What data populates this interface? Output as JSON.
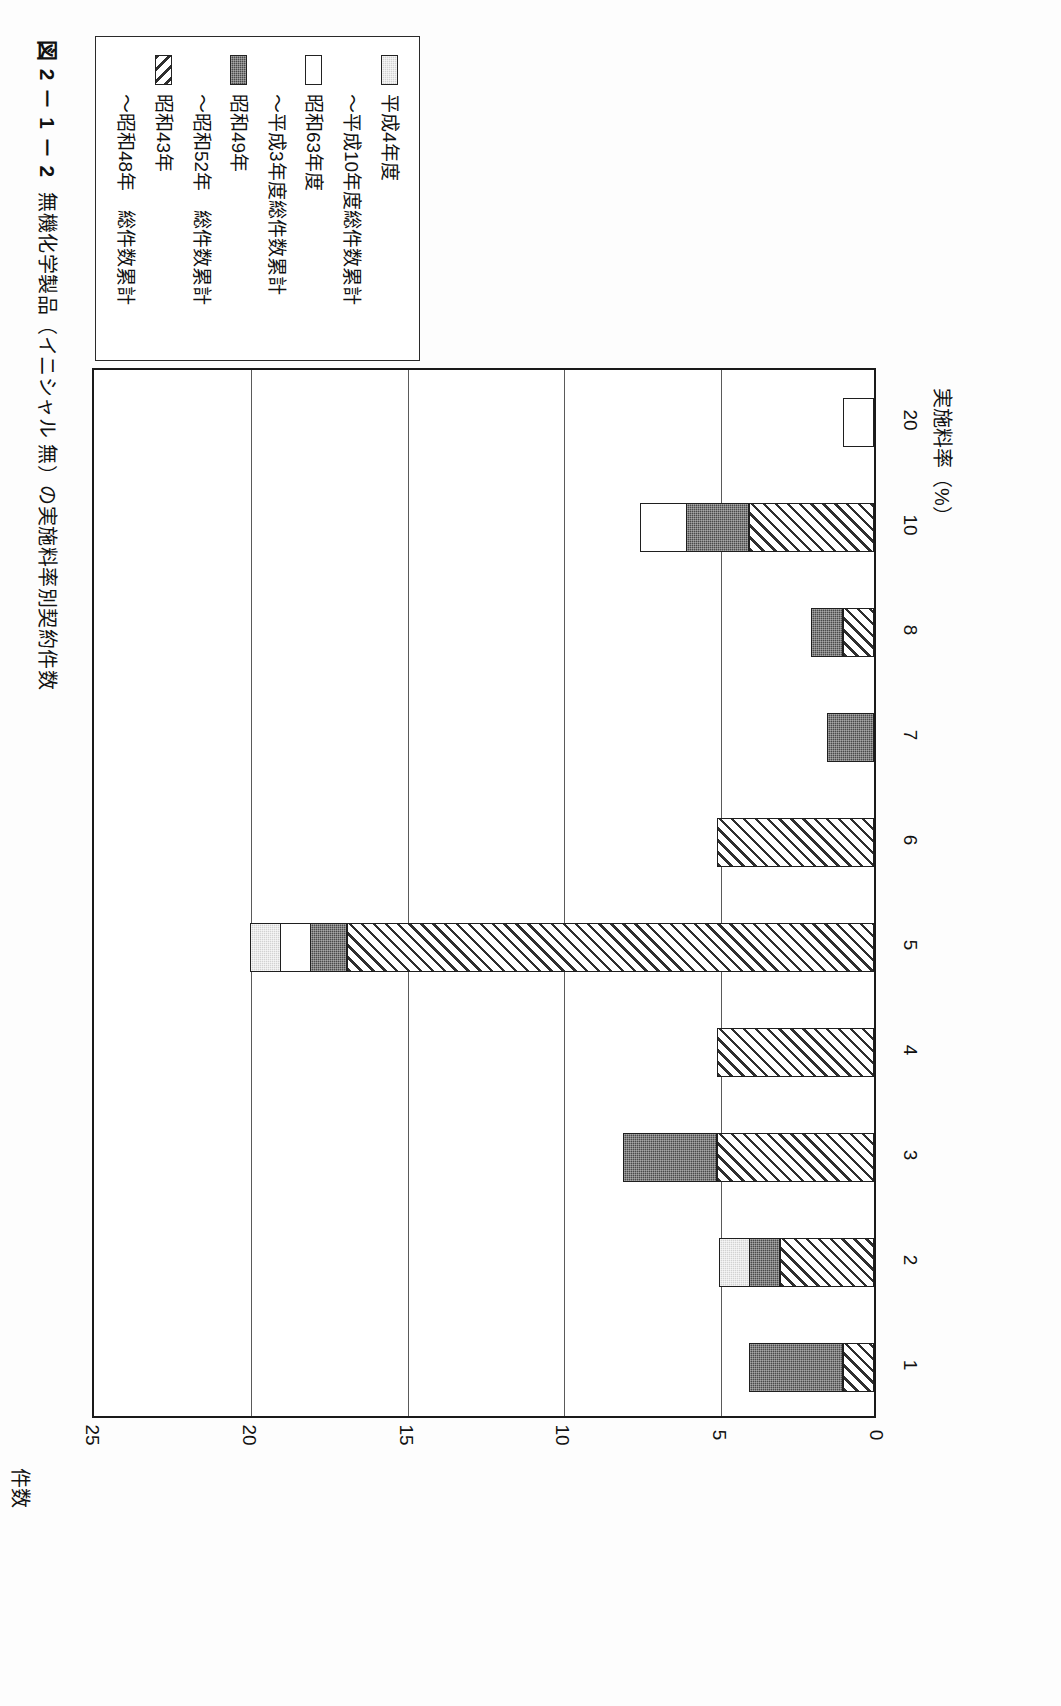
{
  "figure": {
    "number": "図 2 － 1 － 2",
    "title": "無機化学製品（イニシャル 無）の実施料率別契約件数"
  },
  "legend": {
    "items": [
      {
        "swatch": "light-gray-swatch",
        "fill": "gray",
        "label": "平成4年度"
      },
      {
        "swatch": "none",
        "fill": "none",
        "label": "～平成10年度総件数累計"
      },
      {
        "swatch": "white-swatch",
        "fill": "white",
        "label": "昭和63年度"
      },
      {
        "swatch": "none",
        "fill": "none",
        "label": "～平成3年度総件数累計"
      },
      {
        "swatch": "dark-swatch",
        "fill": "dark",
        "label": "昭和49年"
      },
      {
        "swatch": "none",
        "fill": "none",
        "label": "～昭和52年　総件数累計"
      },
      {
        "swatch": "hatched-swatch",
        "fill": "hatch",
        "label": "昭和43年"
      },
      {
        "swatch": "none",
        "fill": "none",
        "label": "～昭和48年　総件数累計"
      }
    ]
  },
  "axes": {
    "value_axis_title": "件数",
    "value_ticks": [
      "25",
      "20",
      "15",
      "10",
      "5",
      "0"
    ],
    "category_axis_title": "実施料率（%）",
    "category_ticks": [
      "1",
      "2",
      "3",
      "4",
      "5",
      "6",
      "7",
      "8",
      "10",
      "20"
    ]
  },
  "chart_data": {
    "type": "bar",
    "orientation": "horizontal-stacked",
    "title": "無機化学製品（イニシャル 無）の実施料率別契約件数",
    "xlabel": "実施料率（%）",
    "ylabel": "件数",
    "ylim": [
      0,
      25
    ],
    "yticks": [
      0,
      5,
      10,
      15,
      20,
      25
    ],
    "grid": true,
    "legend_position": "top-left",
    "categories": [
      "1",
      "2",
      "3",
      "4",
      "5",
      "6",
      "7",
      "8",
      "10",
      "20"
    ],
    "series": [
      {
        "name": "昭和43年～昭和48年　総件数累計",
        "fill": "hatch",
        "values": [
          1,
          3,
          5,
          5,
          16.8,
          5,
          0,
          1,
          4,
          0
        ]
      },
      {
        "name": "昭和49年～昭和52年　総件数累計",
        "fill": "dark",
        "values": [
          3,
          1,
          3,
          0,
          1.2,
          0,
          1.5,
          1,
          2,
          0
        ]
      },
      {
        "name": "昭和63年度～平成3年度総件数累計",
        "fill": "white",
        "values": [
          0,
          0,
          0,
          0,
          1,
          0,
          0,
          0,
          1.5,
          1
        ]
      },
      {
        "name": "平成4年度～平成10年度総件数累計",
        "fill": "gray",
        "values": [
          0,
          1,
          0,
          0,
          1,
          0,
          0,
          0,
          0,
          0
        ]
      }
    ],
    "totals": [
      4,
      5,
      8,
      5,
      20,
      5,
      1.5,
      2,
      7.5,
      1
    ]
  }
}
